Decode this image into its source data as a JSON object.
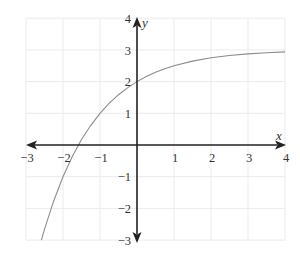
{
  "chart_data": {
    "type": "line",
    "title": "",
    "xlabel": "x",
    "ylabel": "y",
    "xlim": [
      -3,
      4
    ],
    "ylim": [
      -3,
      4
    ],
    "grid": true,
    "legend": null,
    "x_ticks": [
      "−3",
      "−2",
      "−1",
      "1",
      "2",
      "3",
      "4"
    ],
    "y_ticks": [
      "4",
      "3",
      "2",
      "1",
      "−1",
      "−2",
      "−3"
    ],
    "function": "y = 3 - 2^(-x)",
    "asymptote_y": 3,
    "y_intercept": 2,
    "x_intercept": -1.585,
    "series": [
      {
        "name": "curve",
        "color": "#8c8c8c",
        "x": [
          -2.585,
          -2.5,
          -2.25,
          -2,
          -1.75,
          -1.5,
          -1.25,
          -1,
          -0.75,
          -0.5,
          -0.25,
          0,
          0.25,
          0.5,
          0.75,
          1,
          1.5,
          2,
          2.5,
          3,
          3.5,
          4
        ],
        "y": [
          -3.0,
          -2.657,
          -1.757,
          -1.0,
          -0.364,
          0.172,
          0.622,
          1.0,
          1.318,
          1.586,
          1.811,
          2.0,
          2.159,
          2.293,
          2.405,
          2.5,
          2.646,
          2.75,
          2.823,
          2.875,
          2.912,
          2.938
        ]
      }
    ]
  },
  "axes": {
    "x_name": "x",
    "y_name": "y",
    "x_ticks": {
      "m3": "−3",
      "m2": "−2",
      "m1": "−1",
      "p1": "1",
      "p2": "2",
      "p3": "3",
      "p4": "4"
    },
    "y_ticks": {
      "p4": "4",
      "p3": "3",
      "p2": "2",
      "p1": "1",
      "m1": "−1",
      "m2": "−2",
      "m3": "−3"
    }
  },
  "colors": {
    "axis": "#222222",
    "grid": "#ebebeb",
    "curve": "#8c8c8c"
  }
}
